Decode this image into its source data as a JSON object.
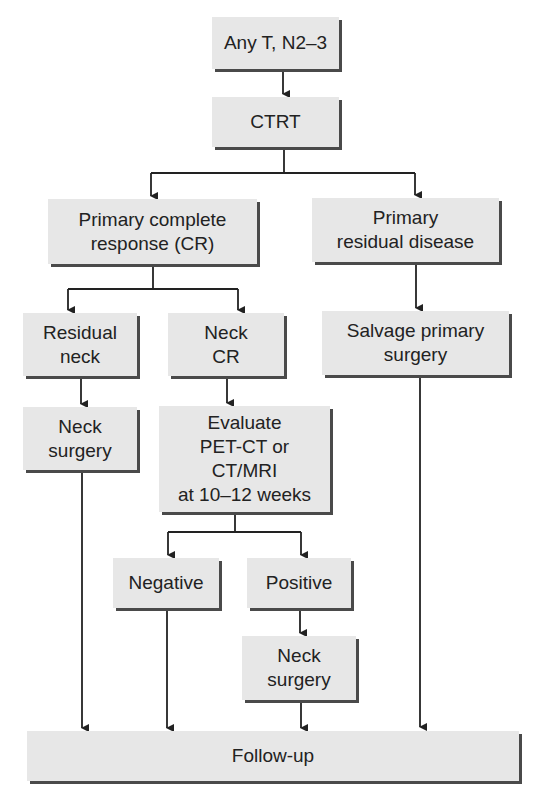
{
  "diagram": {
    "type": "flowchart",
    "colors": {
      "box_fill": "#e7e7e7",
      "box_shadow": "#4a4a4a",
      "text": "#222222",
      "line": "#222222"
    },
    "nodes": {
      "start": {
        "label": "Any T, N2–3"
      },
      "ctrt": {
        "label": "CTRT"
      },
      "primary_cr": {
        "label": "Primary complete\nresponse (CR)"
      },
      "primary_residual": {
        "label": "Primary\nresidual disease"
      },
      "residual_neck": {
        "label": "Residual\nneck"
      },
      "neck_cr": {
        "label": "Neck\nCR"
      },
      "salvage_surgery": {
        "label": "Salvage primary\nsurgery"
      },
      "neck_surgery_1": {
        "label": "Neck\nsurgery"
      },
      "evaluate": {
        "label": "Evaluate\nPET-CT or\nCT/MRI\nat 10–12 weeks"
      },
      "negative": {
        "label": "Negative"
      },
      "positive": {
        "label": "Positive"
      },
      "neck_surgery_2": {
        "label": "Neck\nsurgery"
      },
      "follow_up": {
        "label": "Follow-up"
      }
    },
    "edges": [
      {
        "from": "start",
        "to": "ctrt"
      },
      {
        "from": "ctrt",
        "to": "primary_cr"
      },
      {
        "from": "ctrt",
        "to": "primary_residual"
      },
      {
        "from": "primary_cr",
        "to": "residual_neck"
      },
      {
        "from": "primary_cr",
        "to": "neck_cr"
      },
      {
        "from": "primary_residual",
        "to": "salvage_surgery"
      },
      {
        "from": "residual_neck",
        "to": "neck_surgery_1"
      },
      {
        "from": "neck_cr",
        "to": "evaluate"
      },
      {
        "from": "evaluate",
        "to": "negative"
      },
      {
        "from": "evaluate",
        "to": "positive"
      },
      {
        "from": "positive",
        "to": "neck_surgery_2"
      },
      {
        "from": "neck_surgery_1",
        "to": "follow_up"
      },
      {
        "from": "negative",
        "to": "follow_up"
      },
      {
        "from": "neck_surgery_2",
        "to": "follow_up"
      },
      {
        "from": "salvage_surgery",
        "to": "follow_up"
      }
    ]
  }
}
